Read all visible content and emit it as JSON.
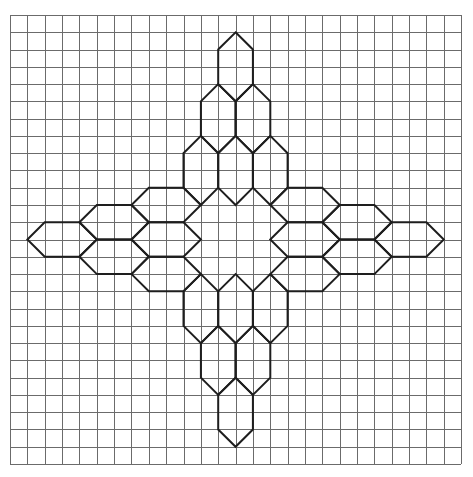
{
  "diagram": {
    "grid": {
      "origin_x": 10,
      "origin_y": 15,
      "cell_w": 17.35,
      "cell_h": 17.27,
      "cols": 26,
      "rows": 26,
      "line_color": "#6b6b6b"
    },
    "hex_stroke_color": "#1e1e1e",
    "vertical_hexes": [
      {
        "arm": "top",
        "cx": 13,
        "cy": 3
      },
      {
        "arm": "top",
        "cx": 12,
        "cy": 6
      },
      {
        "arm": "top",
        "cx": 14,
        "cy": 6
      },
      {
        "arm": "top",
        "cx": 11,
        "cy": 9
      },
      {
        "arm": "top",
        "cx": 13,
        "cy": 9
      },
      {
        "arm": "top",
        "cx": 15,
        "cy": 9
      },
      {
        "arm": "bottom",
        "cx": 11,
        "cy": 17
      },
      {
        "arm": "bottom",
        "cx": 13,
        "cy": 17
      },
      {
        "arm": "bottom",
        "cx": 15,
        "cy": 17
      },
      {
        "arm": "bottom",
        "cx": 12,
        "cy": 20
      },
      {
        "arm": "bottom",
        "cx": 14,
        "cy": 20
      },
      {
        "arm": "bottom",
        "cx": 13,
        "cy": 23
      }
    ],
    "horizontal_hexes": [
      {
        "arm": "left",
        "cx": 3,
        "cy": 13
      },
      {
        "arm": "left",
        "cx": 6,
        "cy": 12
      },
      {
        "arm": "left",
        "cx": 6,
        "cy": 14
      },
      {
        "arm": "left",
        "cx": 9,
        "cy": 11
      },
      {
        "arm": "left",
        "cx": 9,
        "cy": 13
      },
      {
        "arm": "left",
        "cx": 9,
        "cy": 15
      },
      {
        "arm": "right",
        "cx": 17,
        "cy": 11
      },
      {
        "arm": "right",
        "cx": 17,
        "cy": 13
      },
      {
        "arm": "right",
        "cx": 17,
        "cy": 15
      },
      {
        "arm": "right",
        "cx": 20,
        "cy": 12
      },
      {
        "arm": "right",
        "cx": 20,
        "cy": 14
      },
      {
        "arm": "right",
        "cx": 23,
        "cy": 13
      }
    ]
  }
}
